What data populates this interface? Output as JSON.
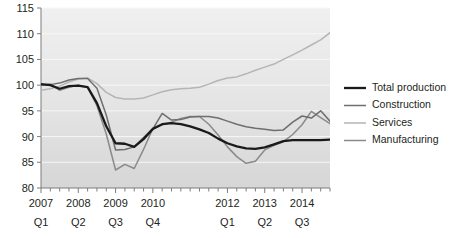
{
  "chart_data": {
    "type": "line",
    "title": "",
    "subtitle": "",
    "xlabel": "",
    "ylabel": "",
    "ylim": [
      80,
      115
    ],
    "yticks": [
      80,
      85,
      90,
      95,
      100,
      105,
      110,
      115
    ],
    "grid": true,
    "grid_axis": "y",
    "legend_position": "right",
    "x": [
      "2007 Q1",
      "2007 Q2",
      "2007 Q3",
      "2007 Q4",
      "2008 Q1",
      "2008 Q2",
      "2008 Q3",
      "2008 Q4",
      "2009 Q1",
      "2009 Q2",
      "2009 Q3",
      "2009 Q4",
      "2010 Q1",
      "2010 Q2",
      "2010 Q3",
      "2010 Q4",
      "2011 Q1",
      "2011 Q2",
      "2011 Q3",
      "2011 Q4",
      "2012 Q1",
      "2012 Q2",
      "2012 Q3",
      "2012 Q4",
      "2013 Q1",
      "2013 Q2",
      "2013 Q3",
      "2013 Q4",
      "2014 Q1",
      "2014 Q2",
      "2014 Q3",
      "2014 Q4"
    ],
    "xtick_year_labels": [
      "2007",
      "2008",
      "2009",
      "2010",
      "2012",
      "2013",
      "2014"
    ],
    "xtick_quarter_labels": [
      "Q1",
      "Q2",
      "Q3",
      "Q4",
      "Q1",
      "Q2",
      "Q3"
    ],
    "xtick_year_positions": [
      0,
      4,
      8,
      12,
      20,
      24,
      28
    ],
    "series": [
      {
        "name": "Total production",
        "color": "#1a1a1a",
        "width": 2.3,
        "values": [
          100.2,
          100.0,
          99.3,
          99.8,
          99.9,
          99.6,
          96.5,
          92.0,
          88.7,
          88.6,
          88.0,
          89.5,
          91.5,
          92.4,
          92.6,
          92.4,
          92.0,
          91.4,
          90.7,
          89.6,
          88.7,
          88.1,
          87.7,
          87.6,
          87.9,
          88.5,
          89.1,
          89.3,
          89.3,
          89.3,
          89.3,
          89.4
        ]
      },
      {
        "name": "Construction",
        "color": "#6e6e6e",
        "width": 1.5,
        "values": [
          100.1,
          100.1,
          100.4,
          101.0,
          101.3,
          101.3,
          99.4,
          94.2,
          87.4,
          87.5,
          88.0,
          89.8,
          91.5,
          94.5,
          93.2,
          93.3,
          93.8,
          93.9,
          93.9,
          93.6,
          93.0,
          92.4,
          91.9,
          91.6,
          91.4,
          91.2,
          91.3,
          92.8,
          94.0,
          93.6,
          95.0,
          93.0
        ]
      },
      {
        "name": "Services",
        "color": "#b5b5b5",
        "width": 1.5,
        "values": [
          99.0,
          99.3,
          99.8,
          100.6,
          101.2,
          101.4,
          100.3,
          98.6,
          97.6,
          97.3,
          97.3,
          97.5,
          98.1,
          98.7,
          99.1,
          99.3,
          99.4,
          99.6,
          100.2,
          100.9,
          101.4,
          101.6,
          102.2,
          102.9,
          103.5,
          104.1,
          105.0,
          105.9,
          106.8,
          107.8,
          108.8,
          110.2
        ]
      },
      {
        "name": "Manufacturing",
        "color": "#8a8a8a",
        "width": 1.5,
        "values": [
          100.0,
          100.2,
          99.0,
          99.6,
          100.0,
          99.6,
          96.0,
          90.5,
          83.5,
          84.6,
          83.8,
          87.5,
          91.6,
          92.3,
          92.8,
          93.5,
          93.9,
          93.9,
          92.4,
          90.3,
          88.0,
          86.1,
          84.8,
          85.2,
          87.4,
          88.3,
          89.0,
          90.4,
          92.3,
          94.9,
          93.7,
          92.5
        ]
      }
    ]
  },
  "legend": {
    "items": [
      {
        "label": "Total production"
      },
      {
        "label": "Construction"
      },
      {
        "label": "Services"
      },
      {
        "label": "Manufacturing"
      }
    ]
  },
  "style": {
    "plot_bg_top": "#efefef",
    "plot_bg_bottom": "#d9d9d9",
    "grid_color": "#f7f7f7",
    "axis_color": "#8a8a8a",
    "text_color": "#231f20",
    "page_bg": "#ffffff"
  }
}
